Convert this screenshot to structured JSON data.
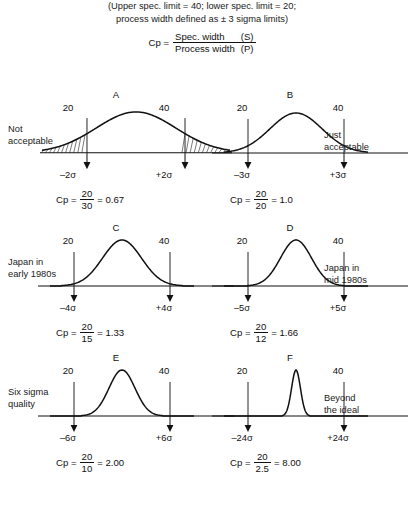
{
  "header": {
    "line1": "(Upper spec. limit = 40; lower spec. limit = 20;",
    "line2": "process width defined as ± 3 sigma limits)",
    "cp_label": "Cp =",
    "numerator": "Spec. width",
    "numerator_sym": "(S)",
    "denominator": "Process width",
    "denominator_sym": "(P)"
  },
  "chart_data": {
    "type": "line",
    "xlabel": "",
    "ylabel": "",
    "spec_lower": 20,
    "spec_upper": 40,
    "spec_width": 20,
    "panels": [
      {
        "letter": "A",
        "side_label": "Not\nacceptable",
        "side_label_line1": "Not",
        "side_label_line2": "acceptable",
        "side_position": "left",
        "lower_spec": "20",
        "upper_spec": "40",
        "sigma_low": "–2σ",
        "sigma_high": "+2σ",
        "cp_label": "Cp =",
        "cp_num": "20",
        "cp_den": "30",
        "cp_eq": "= 0.67",
        "cp_value": 0.67,
        "process_width": 30,
        "sigma_count": 2,
        "curve_sigma": 1.5,
        "shaded_tails": true
      },
      {
        "letter": "B",
        "side_label_line1": "Just",
        "side_label_line2": "acceptable",
        "side_position": "right",
        "lower_spec": "20",
        "upper_spec": "40",
        "sigma_low": "–3σ",
        "sigma_high": "+3σ",
        "cp_label": "Cp =",
        "cp_num": "20",
        "cp_den": "20",
        "cp_eq": "= 1.0",
        "cp_value": 1.0,
        "process_width": 20,
        "sigma_count": 3,
        "curve_sigma": 1.0,
        "shaded_tails": false
      },
      {
        "letter": "C",
        "side_label_line1": "Japan in",
        "side_label_line2": "early 1980s",
        "side_position": "left",
        "lower_spec": "20",
        "upper_spec": "40",
        "sigma_low": "–4σ",
        "sigma_high": "+4σ",
        "cp_label": "Cp =",
        "cp_num": "20",
        "cp_den": "15",
        "cp_eq": "= 1.33",
        "cp_value": 1.33,
        "process_width": 15,
        "sigma_count": 4,
        "curve_sigma": 0.75,
        "shaded_tails": false
      },
      {
        "letter": "D",
        "side_label_line1": "Japan in",
        "side_label_line2": "mid 1980s",
        "side_position": "right",
        "lower_spec": "20",
        "upper_spec": "40",
        "sigma_low": "–5σ",
        "sigma_high": "+5σ",
        "cp_label": "Cp =",
        "cp_num": "20",
        "cp_den": "12",
        "cp_eq": "= 1.66",
        "cp_value": 1.66,
        "process_width": 12,
        "sigma_count": 5,
        "curve_sigma": 0.6,
        "shaded_tails": false
      },
      {
        "letter": "E",
        "side_label_line1": "Six sigma",
        "side_label_line2": "quality",
        "side_position": "left",
        "lower_spec": "20",
        "upper_spec": "40",
        "sigma_low": "–6σ",
        "sigma_high": "+6σ",
        "cp_label": "Cp =",
        "cp_num": "20",
        "cp_den": "10",
        "cp_eq": "= 2.00",
        "cp_value": 2.0,
        "process_width": 10,
        "sigma_count": 6,
        "curve_sigma": 0.5,
        "shaded_tails": false
      },
      {
        "letter": "F",
        "side_label_line1": "Beyond",
        "side_label_line2": "the ideal",
        "side_position": "right",
        "lower_spec": "20",
        "upper_spec": "40",
        "sigma_low": "–24σ",
        "sigma_high": "+24σ",
        "cp_label": "Cp =",
        "cp_num": "20",
        "cp_den": "2.5",
        "cp_eq": "= 8.00",
        "cp_value": 8.0,
        "process_width": 2.5,
        "sigma_count": 24,
        "curve_sigma": 0.17,
        "shaded_tails": false
      }
    ]
  }
}
